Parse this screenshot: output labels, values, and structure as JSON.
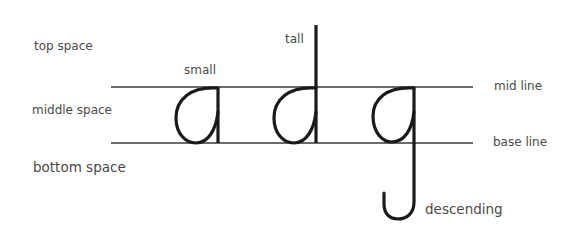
{
  "diagram": {
    "zones": {
      "top": "top space",
      "middle": "middle space",
      "bottom": "bottom space"
    },
    "lines": {
      "mid": "mid line",
      "base": "base line"
    },
    "letters": [
      {
        "glyph": "a",
        "label": "small"
      },
      {
        "glyph": "d",
        "label": "tall"
      },
      {
        "glyph": "g",
        "label": "descending"
      }
    ],
    "colors": {
      "stroke": "#1a1a1a",
      "guide_line": "#3a3a3a",
      "text": "#4a4a4a",
      "background": "#ffffff"
    }
  }
}
